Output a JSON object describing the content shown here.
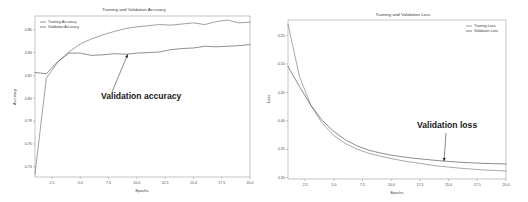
{
  "page": {
    "background_color": "#ffffff",
    "layout": "two charts side by side"
  },
  "chart_data": [
    {
      "id": "accuracy",
      "type": "line",
      "title": "Training and Validation Accuracy",
      "xlabel": "Epochs",
      "ylabel": "Accuracy",
      "xlim": [
        1,
        20
      ],
      "ylim": [
        0.731,
        0.872
      ],
      "xticks": [
        "2.5",
        "5.0",
        "7.5",
        "10.0",
        "12.5",
        "15.0",
        "17.5",
        "20.0"
      ],
      "xtick_values": [
        2.5,
        5.0,
        7.5,
        10.0,
        12.5,
        15.0,
        17.5,
        20.0
      ],
      "yticks": [
        "0.74",
        "0.76",
        "0.78",
        "0.80",
        "0.82",
        "0.84",
        "0.86"
      ],
      "ytick_values": [
        0.74,
        0.76,
        0.78,
        0.8,
        0.82,
        0.84,
        0.86
      ],
      "grid": false,
      "legend_position": "upper left",
      "x": [
        1,
        2,
        3,
        4,
        5,
        6,
        7,
        8,
        9,
        10,
        11,
        12,
        13,
        14,
        15,
        16,
        17,
        18,
        19,
        20
      ],
      "series": [
        {
          "name": "Training Accuracy",
          "color": "#6e6e6e",
          "values": [
            0.7335,
            0.8175,
            0.8315,
            0.8405,
            0.8475,
            0.852,
            0.8555,
            0.8585,
            0.861,
            0.8625,
            0.8635,
            0.8645,
            0.864,
            0.865,
            0.866,
            0.8645,
            0.867,
            0.8685,
            0.866,
            0.8665
          ]
        },
        {
          "name": "Validation Accuracy",
          "color": "#555555",
          "values": [
            0.8225,
            0.8215,
            0.832,
            0.8395,
            0.8395,
            0.8375,
            0.838,
            0.839,
            0.8385,
            0.8395,
            0.84,
            0.8405,
            0.8425,
            0.8435,
            0.844,
            0.8455,
            0.845,
            0.8455,
            0.846,
            0.847
          ]
        }
      ],
      "annotation": {
        "text": "Validation accuracy",
        "points_to_series": "Validation Accuracy",
        "target_x": 9.2,
        "target_y": 0.8385
      }
    },
    {
      "id": "loss",
      "type": "line",
      "title": "Training and Validation Loss",
      "xlabel": "Epochs",
      "ylabel": "Loss",
      "xlim": [
        1,
        20
      ],
      "ylim": [
        0.2975,
        0.5775
      ],
      "xticks": [
        "2.5",
        "5.0",
        "7.5",
        "10.0",
        "12.5",
        "15.0",
        "17.5",
        "20.0"
      ],
      "xtick_values": [
        2.5,
        5.0,
        7.5,
        10.0,
        12.5,
        15.0,
        17.5,
        20.0
      ],
      "yticks": [
        "0.30",
        "0.35",
        "0.40",
        "0.45",
        "0.50",
        "0.55"
      ],
      "ytick_values": [
        0.3,
        0.35,
        0.4,
        0.45,
        0.5,
        0.55
      ],
      "grid": false,
      "legend_position": "upper right",
      "x": [
        1,
        2,
        3,
        4,
        5,
        6,
        7,
        8,
        9,
        10,
        11,
        12,
        13,
        14,
        15,
        16,
        17,
        18,
        19,
        20
      ],
      "series": [
        {
          "name": "Training Loss",
          "color": "#7a7a7a",
          "values": [
            0.57,
            0.478,
            0.427,
            0.395,
            0.374,
            0.36,
            0.35,
            0.343,
            0.338,
            0.3335,
            0.3295,
            0.3265,
            0.3235,
            0.3205,
            0.3185,
            0.3165,
            0.315,
            0.3135,
            0.3125,
            0.3115
          ]
        },
        {
          "name": "Validation Loss",
          "color": "#4f4f4f",
          "values": [
            0.4955,
            0.4605,
            0.427,
            0.4005,
            0.381,
            0.3665,
            0.356,
            0.3485,
            0.3435,
            0.3395,
            0.3365,
            0.334,
            0.332,
            0.33,
            0.3285,
            0.327,
            0.326,
            0.325,
            0.3245,
            0.324
          ]
        }
      ],
      "annotation": {
        "text": "Validation loss",
        "points_to_series": "Validation Loss",
        "target_x": 14.6,
        "target_y": 0.3288
      }
    }
  ]
}
